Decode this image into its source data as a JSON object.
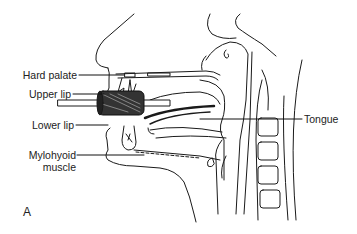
{
  "figure": {
    "panel_letter": "A",
    "labels": {
      "hard_palate": "Hard palate",
      "upper_lip": "Upper lip",
      "lower_lip": "Lower lip",
      "mylohyoid_line1": "Mylohyoid",
      "mylohyoid_line2": "muscle",
      "tongue": "Tongue"
    },
    "colors": {
      "ink": "#1a1a1a",
      "background": "#ffffff"
    }
  }
}
